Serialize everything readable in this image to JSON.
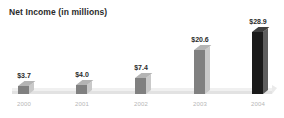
{
  "chart_data": {
    "type": "bar",
    "title": "Net Income (in millions)",
    "xlabel": "",
    "ylabel": "",
    "categories": [
      "2000",
      "2001",
      "2002",
      "2003",
      "2004"
    ],
    "values": [
      3.7,
      4.0,
      7.4,
      20.6,
      28.9
    ],
    "value_labels": [
      "$3.7",
      "$4.0",
      "$7.4",
      "$20.6",
      "$28.9"
    ],
    "ylim": [
      0,
      28.9
    ],
    "grid": false,
    "legend": "none",
    "series": [
      {
        "name": "Net Income",
        "values": [
          3.7,
          4.0,
          7.4,
          20.6,
          28.9
        ]
      }
    ],
    "bar_colors": [
      "#808080",
      "#808080",
      "#808080",
      "#808080",
      "#1a1a1a"
    ],
    "highlight_category": "2004",
    "style": "3d-columns"
  },
  "colors": {
    "background": "#ffffff",
    "title_text": "#2b2b2b",
    "value_text": "#2b2b2b",
    "axis_label_text": "#b6b6b6",
    "bar_fill": "#808080",
    "bar_fill_highlight": "#1a1a1a",
    "bar_side": "#c9c9c9",
    "bar_side_highlight": "#5e5e5e",
    "floor_top": "#f0f0f0",
    "floor_front": "#e2e2e2"
  }
}
